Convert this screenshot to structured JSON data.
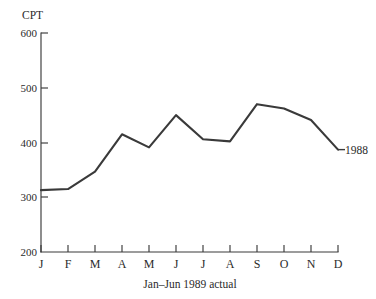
{
  "chart_data": {
    "type": "line",
    "title": "",
    "subtitle": "",
    "xlabel": "",
    "ylabel": "CPT",
    "caption": "Jan–Jun 1989 actual",
    "categories": [
      "J",
      "F",
      "M",
      "A",
      "M",
      "J",
      "J",
      "A",
      "S",
      "O",
      "N",
      "D"
    ],
    "category_names": [
      "Jan",
      "Feb",
      "Mar",
      "Apr",
      "May",
      "Jun",
      "Jul",
      "Aug",
      "Sep",
      "Oct",
      "Nov",
      "Dec"
    ],
    "series": [
      {
        "name": "1988",
        "values": [
          313,
          315,
          347,
          415,
          391,
          450,
          406,
          402,
          470,
          462,
          441,
          387
        ]
      }
    ],
    "annotations": [
      {
        "text": "1988",
        "attached_to": "D",
        "value": 387
      }
    ],
    "ylim": [
      200,
      600
    ],
    "yticks": [
      200,
      300,
      400,
      500,
      600
    ],
    "ytick_labels": [
      "200",
      "300",
      "400",
      "500",
      "600"
    ],
    "grid": false,
    "legend": false,
    "legend_position": "none",
    "line_color": "#3a3a3a",
    "axis_color": "#3a3a3a",
    "background_color": "#ffffff"
  },
  "figure": {
    "ylabel": "CPT",
    "caption": "Jan–Jun 1989 actual",
    "series_label": "1988"
  }
}
